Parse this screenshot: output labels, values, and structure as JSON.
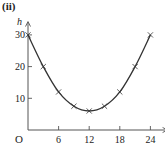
{
  "chart_data": {
    "type": "line",
    "panel_label": "(ii)",
    "title": "",
    "xlabel": "",
    "ylabel": "h",
    "origin_label": "O",
    "x_ticks": [
      6,
      12,
      18,
      24
    ],
    "y_ticks": [
      10,
      20,
      30
    ],
    "xlim": [
      0,
      26
    ],
    "ylim": [
      0,
      32
    ],
    "grid": false,
    "legend": null,
    "marker": "cross",
    "series": [
      {
        "name": "h",
        "x": [
          0,
          3,
          6,
          9,
          12,
          15,
          18,
          21,
          24
        ],
        "y": [
          30,
          20,
          12,
          7.5,
          6,
          7.5,
          12,
          20,
          30
        ]
      }
    ],
    "colors": {
      "line": "#333333",
      "axis": "#555555",
      "text": "#222222"
    }
  }
}
